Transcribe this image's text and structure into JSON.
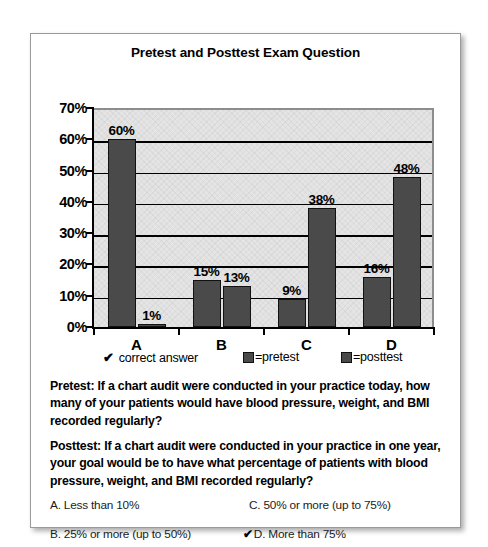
{
  "chart_data": {
    "type": "bar",
    "title": "Pretest and Posttest Exam Question",
    "categories": [
      "A",
      "B",
      "C",
      "D"
    ],
    "series": [
      {
        "name": "pretest",
        "values": [
          60,
          15,
          9,
          16
        ]
      },
      {
        "name": "posttest",
        "values": [
          1,
          13,
          38,
          48
        ]
      }
    ],
    "value_labels": [
      [
        "60%",
        "1%"
      ],
      [
        "15%",
        "13%"
      ],
      [
        "9%",
        "38%"
      ],
      [
        "16%",
        "48%"
      ]
    ],
    "xlabel": "",
    "ylabel": "",
    "ylim": [
      0,
      70
    ],
    "ytick_labels": [
      "0%",
      "10%",
      "20%",
      "30%",
      "40%",
      "50%",
      "60%",
      "70%"
    ],
    "ytick_values": [
      0,
      10,
      20,
      30,
      40,
      50,
      60,
      70
    ],
    "grid": true,
    "legend_position": "below",
    "bar_color": "#4a4a4a",
    "plot_background": "#e4e4e4"
  },
  "legend": {
    "correct_answer": {
      "check": "✔",
      "label": "correct answer"
    },
    "pretest": {
      "label": "=pretest"
    },
    "posttest": {
      "label": "=posttest"
    }
  },
  "questions": {
    "pretest": "Pretest: If a chart audit were conducted in your  practice today, how many of your patients would have blood pressure, weight, and BMI recorded regularly?",
    "posttest": "Posttest: If a chart audit were conducted in your practice in one year, your goal would be to  have what percentage of patients with blood  pressure, weight, and BMI recorded regularly?"
  },
  "options": [
    {
      "id": "a",
      "text": "A. Less than 10%",
      "correct": false,
      "check": ""
    },
    {
      "id": "b",
      "text": "B. 25% or more (up to 50%)",
      "correct": false,
      "check": ""
    },
    {
      "id": "c",
      "text": "C. 50% or more (up to 75%)",
      "correct": false,
      "check": ""
    },
    {
      "id": "d",
      "text": "D. More than 75%",
      "correct": true,
      "check": "✔"
    }
  ]
}
